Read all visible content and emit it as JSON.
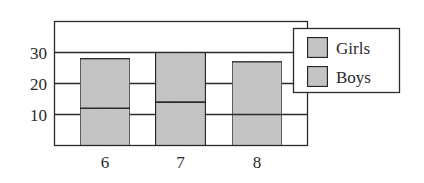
{
  "chart_data": {
    "type": "bar",
    "stacked": true,
    "title": "",
    "xlabel": "",
    "ylabel": "",
    "categories": [
      "6",
      "7",
      "8"
    ],
    "series": [
      {
        "name": "Boys",
        "values": [
          12,
          14,
          10
        ]
      },
      {
        "name": "Girls",
        "values": [
          16,
          16,
          17
        ]
      }
    ],
    "totals": [
      28,
      30,
      27
    ],
    "ylim": [
      0,
      40
    ],
    "yticks": [
      10,
      20,
      30
    ],
    "ytick_labels": [
      "10",
      "20",
      "30"
    ],
    "grid": true,
    "legend_position": "upper right (outside plot, overlapping)",
    "legend": [
      "Girls",
      "Boys"
    ]
  },
  "colors": {
    "bar_fill": "#c9c9c9",
    "line": "#2b2b2b",
    "background": "#ffffff"
  }
}
